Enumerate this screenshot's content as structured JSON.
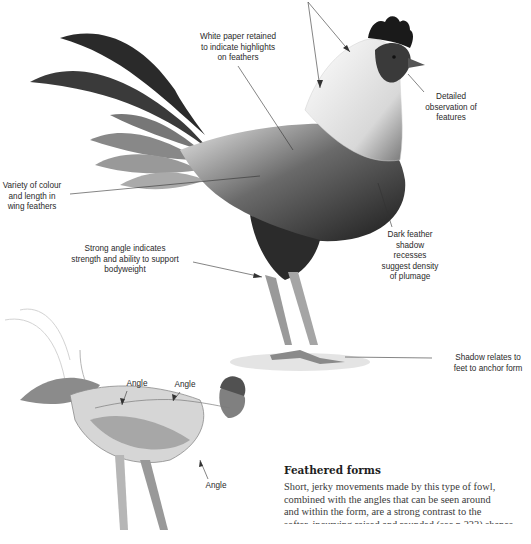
{
  "annotations": {
    "white_paper": "White paper retained\nto indicate highlights\non feathers",
    "detailed_observation": "Detailed\nobservation of\nfeatures",
    "variety_colour": "Variety of colour\nand length in\nwing feathers",
    "dark_feather": "Dark feather\nshadow\nrecesses\nsuggest density\nof plumage",
    "strong_angle": "Strong angle indicates\nstrength and ability to support\nbodyweight",
    "shadow_relates": "Shadow relates to\nfeet to anchor form",
    "angle_1": "Angle",
    "angle_2": "Angle",
    "angle_3": "Angle"
  },
  "section": {
    "heading": "Feathered forms",
    "lines": [
      "Short, jerky movements made by this type of fowl,",
      "combined with the angles that can be seen around",
      "and within the form, are a strong contrast to the",
      "softer, incurving raised and rounded (see p.233) shapes"
    ]
  },
  "illustrations": {
    "main": "rooster-drawing-detailed",
    "sketch": "rooster-sketch-angles"
  }
}
